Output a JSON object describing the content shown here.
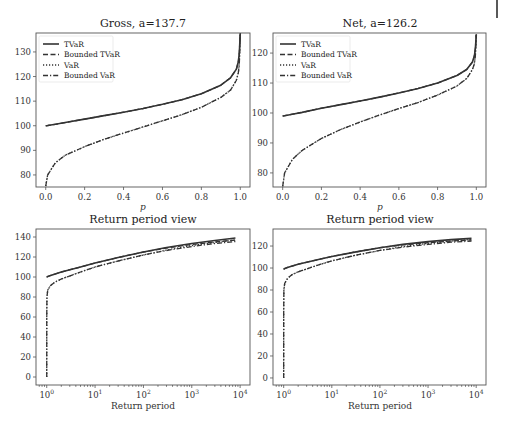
{
  "corner_mark": {
    "color": "#222222"
  },
  "legend": [
    "TVaR",
    "Bounded TVaR",
    "VaR",
    "Bounded VaR"
  ],
  "chart_data": [
    {
      "type": "line",
      "title": "Gross, a=137.7",
      "xlabel": "p",
      "ylabel": "",
      "xlim": [
        -0.05,
        1.05
      ],
      "ylim": [
        75.1,
        137.7
      ],
      "xscale": "linear",
      "xticks": [
        0.0,
        0.2,
        0.4,
        0.6,
        0.8,
        1.0
      ],
      "xtick_labels": [
        "0.0",
        "0.2",
        "0.4",
        "0.6",
        "0.8",
        "1.0"
      ],
      "yticks": [
        80,
        90,
        100,
        110,
        120,
        130
      ],
      "ytick_labels": [
        "80",
        "90",
        "100",
        "110",
        "120",
        "130"
      ],
      "legend_position": "upper left",
      "grid": false,
      "x": [
        0.0,
        0.01,
        0.05,
        0.1,
        0.2,
        0.3,
        0.4,
        0.5,
        0.6,
        0.7,
        0.8,
        0.9,
        0.95,
        0.98,
        0.99,
        0.995,
        1.0
      ],
      "series": [
        {
          "name": "TVaR",
          "style": "solid",
          "values": [
            100.0,
            100.1,
            100.6,
            101.3,
            102.7,
            104.1,
            105.5,
            107.0,
            108.7,
            110.6,
            113.0,
            116.5,
            119.5,
            123.0,
            126.0,
            129.5,
            137.7
          ]
        },
        {
          "name": "Bounded TVaR",
          "style": "dashed",
          "values": [
            100.0,
            100.1,
            100.6,
            101.3,
            102.7,
            104.1,
            105.5,
            107.0,
            108.7,
            110.6,
            113.0,
            116.5,
            119.5,
            123.0,
            126.0,
            129.5,
            137.7
          ]
        },
        {
          "name": "VaR",
          "style": "dotted",
          "values": [
            75.5,
            80.0,
            85.0,
            88.0,
            91.5,
            94.5,
            97.0,
            99.5,
            102.0,
            104.5,
            107.5,
            111.5,
            114.5,
            118.5,
            121.5,
            125.0,
            137.7
          ]
        },
        {
          "name": "Bounded VaR",
          "style": "dashdot",
          "values": [
            75.5,
            80.0,
            85.0,
            88.0,
            91.5,
            94.5,
            97.0,
            99.5,
            102.0,
            104.5,
            107.5,
            111.5,
            114.5,
            118.5,
            121.5,
            125.0,
            137.7
          ]
        }
      ]
    },
    {
      "type": "line",
      "title": "Net, a=126.2",
      "xlabel": "p",
      "ylabel": "",
      "xlim": [
        -0.05,
        1.05
      ],
      "ylim": [
        75.3,
        126.7
      ],
      "xscale": "linear",
      "xticks": [
        0.0,
        0.2,
        0.4,
        0.6,
        0.8,
        1.0
      ],
      "xtick_labels": [
        "0.0",
        "0.2",
        "0.4",
        "0.6",
        "0.8",
        "1.0"
      ],
      "yticks": [
        80,
        90,
        100,
        110,
        120
      ],
      "ytick_labels": [
        "80",
        "90",
        "100",
        "110",
        "120"
      ],
      "legend_position": "upper left",
      "grid": false,
      "x": [
        0.0,
        0.01,
        0.05,
        0.1,
        0.2,
        0.3,
        0.4,
        0.5,
        0.6,
        0.7,
        0.8,
        0.9,
        0.95,
        0.98,
        0.99,
        0.995,
        1.0
      ],
      "series": [
        {
          "name": "TVaR",
          "style": "solid",
          "values": [
            99.0,
            99.1,
            99.6,
            100.2,
            101.6,
            102.8,
            104.0,
            105.3,
            106.7,
            108.2,
            110.0,
            112.5,
            114.5,
            117.0,
            119.0,
            121.5,
            126.2
          ]
        },
        {
          "name": "Bounded TVaR",
          "style": "dashed",
          "values": [
            99.0,
            99.1,
            99.6,
            100.2,
            101.6,
            102.8,
            104.0,
            105.3,
            106.7,
            108.2,
            110.0,
            112.5,
            114.5,
            117.0,
            119.0,
            121.5,
            126.2
          ]
        },
        {
          "name": "VaR",
          "style": "dotted",
          "values": [
            75.5,
            80.0,
            84.5,
            87.5,
            91.5,
            94.5,
            97.0,
            99.3,
            101.5,
            103.5,
            106.0,
            109.0,
            111.5,
            114.5,
            116.5,
            119.0,
            126.2
          ]
        },
        {
          "name": "Bounded VaR",
          "style": "dashdot",
          "values": [
            75.5,
            80.0,
            84.5,
            87.5,
            91.5,
            94.5,
            97.0,
            99.3,
            101.5,
            103.5,
            106.0,
            109.0,
            111.5,
            114.5,
            116.5,
            119.0,
            126.2
          ]
        }
      ]
    },
    {
      "type": "line",
      "title": "Return period view",
      "xlabel": "Return period",
      "ylabel": "",
      "xscale": "log",
      "xlim": [
        0.6,
        16000
      ],
      "ylim": [
        -8,
        148
      ],
      "xticks": [
        1,
        10,
        100,
        1000,
        10000
      ],
      "xtick_labels": [
        "10^0",
        "10^1",
        "10^2",
        "10^3",
        "10^4"
      ],
      "yticks": [
        0,
        20,
        40,
        60,
        80,
        100,
        120,
        140
      ],
      "ytick_labels": [
        "0",
        "20",
        "40",
        "60",
        "80",
        "100",
        "120",
        "140"
      ],
      "grid": false,
      "x": [
        1.0,
        1.001,
        1.01,
        1.05,
        1.2,
        1.5,
        2,
        5,
        10,
        30,
        100,
        300,
        1000,
        3000,
        8000
      ],
      "series": [
        {
          "name": "TVaR",
          "style": "solid",
          "values": [
            100.0,
            100.0,
            100.1,
            100.5,
            101.5,
            103.0,
            105.0,
            110.0,
            114.0,
            119.5,
            125.0,
            129.5,
            133.5,
            136.5,
            139.0
          ]
        },
        {
          "name": "Bounded TVaR",
          "style": "dashed",
          "values": [
            100.0,
            100.0,
            100.1,
            100.5,
            101.5,
            103.0,
            105.0,
            110.0,
            114.0,
            119.5,
            125.0,
            129.0,
            132.5,
            135.0,
            137.0
          ]
        },
        {
          "name": "VaR",
          "style": "dotted",
          "values": [
            0.0,
            60.0,
            80.0,
            87.0,
            91.5,
            95.0,
            98.0,
            105.0,
            110.0,
            116.0,
            122.0,
            127.0,
            131.5,
            134.5,
            137.0
          ]
        },
        {
          "name": "Bounded VaR",
          "style": "dashdot",
          "values": [
            0.0,
            60.0,
            80.0,
            87.0,
            91.5,
            95.0,
            98.0,
            105.0,
            110.0,
            116.0,
            122.0,
            126.5,
            130.5,
            133.5,
            135.5
          ]
        }
      ]
    },
    {
      "type": "line",
      "title": "Return period view",
      "xlabel": "Return period",
      "ylabel": "",
      "xscale": "log",
      "xlim": [
        0.6,
        16000
      ],
      "ylim": [
        -6.4,
        135.5
      ],
      "xticks": [
        1,
        10,
        100,
        1000,
        10000
      ],
      "xtick_labels": [
        "10^0",
        "10^1",
        "10^2",
        "10^3",
        "10^4"
      ],
      "yticks": [
        0,
        20,
        40,
        60,
        80,
        100,
        120
      ],
      "ytick_labels": [
        "0",
        "20",
        "40",
        "60",
        "80",
        "100",
        "120"
      ],
      "grid": false,
      "x": [
        1.0,
        1.001,
        1.01,
        1.05,
        1.2,
        1.5,
        2,
        5,
        10,
        30,
        100,
        300,
        1000,
        3000,
        8000
      ],
      "series": [
        {
          "name": "TVaR",
          "style": "solid",
          "values": [
            99.0,
            99.0,
            99.1,
            99.5,
            100.5,
            101.8,
            103.5,
            107.5,
            110.5,
            114.5,
            118.5,
            121.5,
            124.0,
            125.8,
            127.0
          ]
        },
        {
          "name": "Bounded TVaR",
          "style": "dashed",
          "values": [
            99.0,
            99.0,
            99.1,
            99.5,
            100.5,
            101.8,
            103.5,
            107.5,
            110.5,
            114.5,
            118.5,
            121.0,
            123.0,
            124.5,
            125.5
          ]
        },
        {
          "name": "VaR",
          "style": "dotted",
          "values": [
            0.0,
            60.0,
            80.0,
            86.0,
            90.5,
            94.0,
            96.5,
            102.5,
            106.5,
            111.5,
            116.0,
            119.5,
            122.5,
            124.5,
            126.0
          ]
        },
        {
          "name": "Bounded VaR",
          "style": "dashdot",
          "values": [
            0.0,
            60.0,
            80.0,
            86.0,
            90.5,
            94.0,
            96.5,
            102.5,
            106.5,
            111.5,
            116.0,
            119.0,
            121.5,
            123.5,
            124.5
          ]
        }
      ]
    }
  ]
}
